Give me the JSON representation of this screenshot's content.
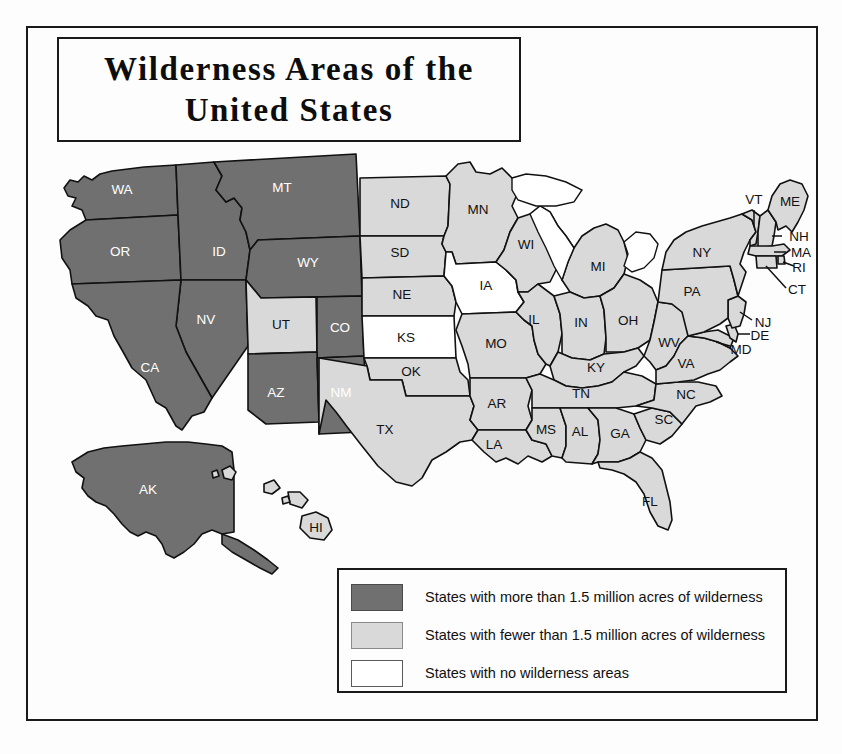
{
  "title": {
    "line1": "Wilderness Areas of the",
    "line2": "United States",
    "full": "Wilderness Areas of the United States"
  },
  "legend": {
    "items": [
      {
        "swatch": "dark",
        "color": "#707070",
        "label": "States with more than 1.5 million acres of wilderness"
      },
      {
        "swatch": "light",
        "color": "#d9d9d9",
        "label": "States with fewer than 1.5 million acres of wilderness"
      },
      {
        "swatch": "none",
        "color": "#ffffff",
        "label": "States with no wilderness areas"
      }
    ]
  },
  "map": {
    "categories": {
      "dark": "more than 1.5 million acres of wilderness",
      "light": "fewer than 1.5 million acres of wilderness",
      "none": "no wilderness areas"
    },
    "states": [
      {
        "code": "WA",
        "category": "dark"
      },
      {
        "code": "OR",
        "category": "dark"
      },
      {
        "code": "ID",
        "category": "dark"
      },
      {
        "code": "MT",
        "category": "dark"
      },
      {
        "code": "WY",
        "category": "dark"
      },
      {
        "code": "NV",
        "category": "dark"
      },
      {
        "code": "CA",
        "category": "dark"
      },
      {
        "code": "UT",
        "category": "light"
      },
      {
        "code": "CO",
        "category": "dark"
      },
      {
        "code": "AZ",
        "category": "dark"
      },
      {
        "code": "NM",
        "category": "dark"
      },
      {
        "code": "ND",
        "category": "light"
      },
      {
        "code": "SD",
        "category": "light"
      },
      {
        "code": "NE",
        "category": "light"
      },
      {
        "code": "KS",
        "category": "none"
      },
      {
        "code": "OK",
        "category": "light"
      },
      {
        "code": "TX",
        "category": "light"
      },
      {
        "code": "MN",
        "category": "light"
      },
      {
        "code": "IA",
        "category": "none"
      },
      {
        "code": "MO",
        "category": "light"
      },
      {
        "code": "AR",
        "category": "light"
      },
      {
        "code": "LA",
        "category": "light"
      },
      {
        "code": "WI",
        "category": "light"
      },
      {
        "code": "IL",
        "category": "light"
      },
      {
        "code": "MI",
        "category": "light"
      },
      {
        "code": "IN",
        "category": "light"
      },
      {
        "code": "OH",
        "category": "light"
      },
      {
        "code": "KY",
        "category": "light"
      },
      {
        "code": "TN",
        "category": "light"
      },
      {
        "code": "MS",
        "category": "light"
      },
      {
        "code": "AL",
        "category": "light"
      },
      {
        "code": "GA",
        "category": "light"
      },
      {
        "code": "FL",
        "category": "light"
      },
      {
        "code": "SC",
        "category": "light"
      },
      {
        "code": "NC",
        "category": "light"
      },
      {
        "code": "VA",
        "category": "light"
      },
      {
        "code": "WV",
        "category": "light"
      },
      {
        "code": "MD",
        "category": "light"
      },
      {
        "code": "DE",
        "category": "light"
      },
      {
        "code": "NJ",
        "category": "light"
      },
      {
        "code": "PA",
        "category": "light"
      },
      {
        "code": "NY",
        "category": "light"
      },
      {
        "code": "CT",
        "category": "light"
      },
      {
        "code": "RI",
        "category": "light"
      },
      {
        "code": "MA",
        "category": "light"
      },
      {
        "code": "VT",
        "category": "light"
      },
      {
        "code": "NH",
        "category": "light"
      },
      {
        "code": "ME",
        "category": "light"
      },
      {
        "code": "AK",
        "category": "dark"
      },
      {
        "code": "HI",
        "category": "light"
      }
    ],
    "labels": {
      "WA": "WA",
      "OR": "OR",
      "ID": "ID",
      "MT": "MT",
      "WY": "WY",
      "NV": "NV",
      "CA": "CA",
      "UT": "UT",
      "CO": "CO",
      "AZ": "AZ",
      "NM": "NM",
      "ND": "ND",
      "SD": "SD",
      "NE": "NE",
      "KS": "KS",
      "OK": "OK",
      "TX": "TX",
      "MN": "MN",
      "IA": "IA",
      "MO": "MO",
      "AR": "AR",
      "LA": "LA",
      "WI": "WI",
      "IL": "IL",
      "MI": "MI",
      "IN": "IN",
      "OH": "OH",
      "KY": "KY",
      "TN": "TN",
      "MS": "MS",
      "AL": "AL",
      "GA": "GA",
      "FL": "FL",
      "SC": "SC",
      "NC": "NC",
      "VA": "VA",
      "WV": "WV",
      "MD": "MD",
      "DE": "DE",
      "NJ": "NJ",
      "PA": "PA",
      "NY": "NY",
      "CT": "CT",
      "RI": "RI",
      "MA": "MA",
      "VT": "VT",
      "NH": "NH",
      "ME": "ME",
      "AK": "AK",
      "HI": "HI"
    }
  }
}
